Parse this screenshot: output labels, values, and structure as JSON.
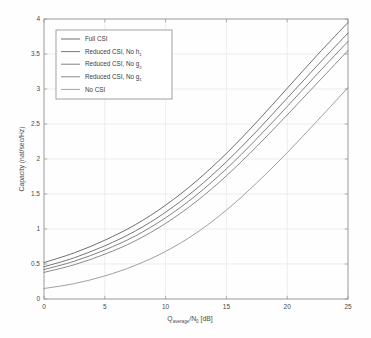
{
  "figure": {
    "background": "#fefefe",
    "frame_color": "#9a9a9a",
    "grid_color": "#e2e2e2",
    "text_color": "#4a4a4a"
  },
  "chart_data": {
    "type": "line",
    "title": "",
    "xlabel": "Q_average/N_0 [dB]",
    "xlabel_parts": {
      "main1": "Q",
      "sub1": "average",
      "mid": "/N",
      "sub2": "0",
      "main2": " [dB]"
    },
    "ylabel": "Capacity (nat/sec/Hz)",
    "xlim": [
      0,
      25
    ],
    "ylim": [
      0,
      4
    ],
    "xticks": [
      0,
      5,
      10,
      15,
      20,
      25
    ],
    "yticks": [
      0,
      0.5,
      1,
      1.5,
      2,
      2.5,
      3,
      3.5,
      4
    ],
    "xticklabels": [
      "0",
      "5",
      "10",
      "15",
      "20",
      "25"
    ],
    "yticklabels": [
      "0",
      "0.5",
      "1",
      "1.5",
      "2",
      "2.5",
      "3",
      "3.5",
      "4"
    ],
    "grid": true,
    "legend_position": "upper left",
    "x": [
      0,
      2.5,
      5,
      7.5,
      10,
      12.5,
      15,
      17.5,
      20,
      22.5,
      25
    ],
    "series": [
      {
        "name": "Full CSI",
        "color": "#555555",
        "values": [
          0.52,
          0.66,
          0.84,
          1.06,
          1.34,
          1.68,
          2.08,
          2.53,
          3.01,
          3.49,
          3.95
        ]
      },
      {
        "name": "Reduced CSI, No h_1",
        "color": "#606060",
        "values": [
          0.46,
          0.59,
          0.76,
          0.97,
          1.24,
          1.57,
          1.96,
          2.4,
          2.87,
          3.34,
          3.8
        ]
      },
      {
        "name": "Reduced CSI, No g_2",
        "color": "#6b6b6b",
        "values": [
          0.42,
          0.54,
          0.7,
          0.9,
          1.16,
          1.48,
          1.86,
          2.29,
          2.75,
          3.22,
          3.68
        ]
      },
      {
        "name": "Reduced CSI, No g_1",
        "color": "#767676",
        "values": [
          0.38,
          0.49,
          0.64,
          0.83,
          1.08,
          1.39,
          1.76,
          2.18,
          2.63,
          3.09,
          3.55
        ]
      },
      {
        "name": "No CSI",
        "color": "#8f8f8f",
        "values": [
          0.15,
          0.22,
          0.33,
          0.48,
          0.68,
          0.94,
          1.27,
          1.66,
          2.09,
          2.55,
          3.02
        ]
      }
    ]
  },
  "legend": {
    "entries": [
      {
        "label": "Full CSI",
        "base": "Full CSI",
        "subscript": ""
      },
      {
        "label": "Reduced CSI, No h",
        "base": "Reduced CSI, No h",
        "subscript": "1"
      },
      {
        "label": "Reduced CSI, No g",
        "base": "Reduced CSI, No g",
        "subscript": "2"
      },
      {
        "label": "Reduced CSI, No g",
        "base": "Reduced CSI, No g",
        "subscript": "1"
      },
      {
        "label": "No CSI",
        "base": "No CSI",
        "subscript": ""
      }
    ]
  }
}
